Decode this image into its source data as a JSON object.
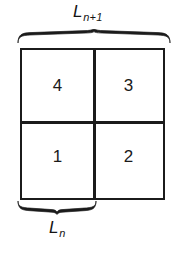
{
  "figure": {
    "type": "quadrant-diagram",
    "background_color": "#ffffff",
    "line_color": "#1b1b1b",
    "text_color": "#1a1a1a"
  },
  "top_measure": {
    "base": "L",
    "subscript": "n+1",
    "span": "full-width",
    "brace_name": "top-brace"
  },
  "bottom_measure": {
    "base": "L",
    "subscript": "n",
    "span": "left-half",
    "brace_name": "bottom-brace"
  },
  "grid": {
    "rows": 2,
    "columns": 2,
    "cells": [
      {
        "id": "cell-4",
        "label": "4",
        "row": "top",
        "column": "left"
      },
      {
        "id": "cell-3",
        "label": "3",
        "row": "top",
        "column": "right"
      },
      {
        "id": "cell-1",
        "label": "1",
        "row": "bottom",
        "column": "left"
      },
      {
        "id": "cell-2",
        "label": "2",
        "row": "bottom",
        "column": "right"
      }
    ]
  }
}
